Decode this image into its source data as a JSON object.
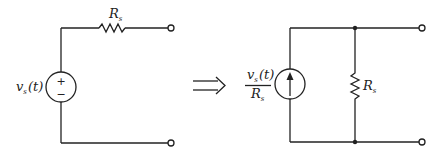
{
  "diagram": {
    "left_circuit": {
      "source_label": "v",
      "source_sub": "s",
      "source_arg": "(t)",
      "source_type": "voltage-source",
      "plus_sign": "+",
      "minus_sign": "−",
      "resistor_label": "R",
      "resistor_sub": "s",
      "resistor_connection": "series"
    },
    "transform_symbol": "⟹",
    "right_circuit": {
      "source_num_label": "v",
      "source_num_sub": "s",
      "source_num_arg": "(t)",
      "source_den_label": "R",
      "source_den_sub": "s",
      "source_type": "current-source",
      "current_direction": "up",
      "resistor_label": "R",
      "resistor_sub": "s",
      "resistor_connection": "parallel"
    },
    "colors": {
      "line": "#222222",
      "background": "#ffffff"
    }
  }
}
